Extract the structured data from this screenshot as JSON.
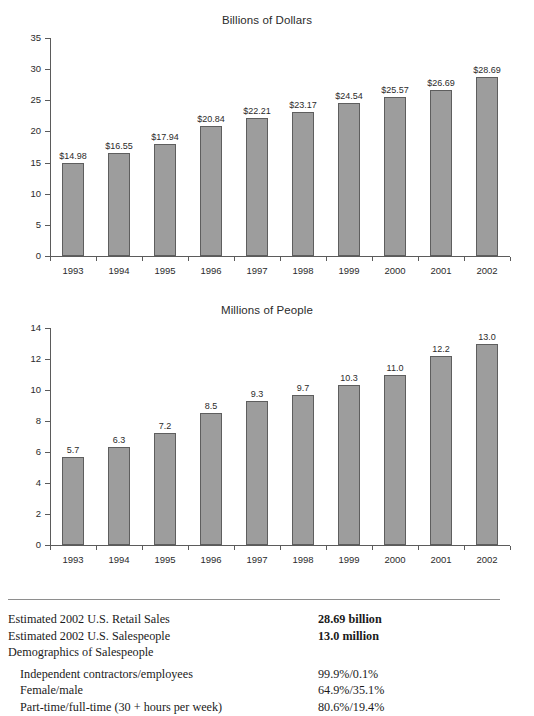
{
  "chart_data": [
    {
      "type": "bar",
      "title": "Billions of Dollars",
      "xlabel": "",
      "ylabel": "",
      "ylim": [
        0,
        35
      ],
      "yticks": [
        0,
        5,
        10,
        15,
        20,
        25,
        30,
        35
      ],
      "ytick_labels": [
        "0",
        "5",
        "10",
        "15",
        "20",
        "25",
        "30",
        "35"
      ],
      "grid": false,
      "legend": "none",
      "categories": [
        "1993",
        "1994",
        "1995",
        "1996",
        "1997",
        "1998",
        "1999",
        "2000",
        "2001",
        "2002"
      ],
      "values": [
        14.98,
        16.55,
        17.94,
        20.84,
        22.21,
        23.17,
        24.54,
        25.57,
        26.69,
        28.69
      ],
      "data_labels": [
        "$14.98",
        "$16.55",
        "$17.94",
        "$20.84",
        "$22.21",
        "$23.17",
        "$24.54",
        "$25.57",
        "$26.69",
        "$28.69"
      ],
      "bar_color": "#9d9d9d",
      "bar_border_color": "#5e5e5e"
    },
    {
      "type": "bar",
      "title": "Millions of People",
      "xlabel": "",
      "ylabel": "",
      "ylim": [
        0,
        14
      ],
      "yticks": [
        0,
        2,
        4,
        6,
        8,
        10,
        12,
        14
      ],
      "ytick_labels": [
        "0",
        "2",
        "4",
        "6",
        "8",
        "10",
        "12",
        "14"
      ],
      "grid": false,
      "legend": "none",
      "categories": [
        "1993",
        "1994",
        "1995",
        "1996",
        "1997",
        "1998",
        "1999",
        "2000",
        "2001",
        "2002"
      ],
      "values": [
        5.7,
        6.3,
        7.2,
        8.5,
        9.3,
        9.7,
        10.3,
        11.0,
        12.2,
        13.0
      ],
      "data_labels": [
        "5.7",
        "6.3",
        "7.2",
        "8.5",
        "9.3",
        "9.7",
        "10.3",
        "11.0",
        "12.2",
        "13.0"
      ],
      "bar_color": "#9d9d9d",
      "bar_border_color": "#5e5e5e"
    }
  ],
  "summary": {
    "rows": [
      {
        "label": "Estimated 2002 U.S. Retail Sales",
        "value": "28.69 billion",
        "bold": true,
        "indent": false
      },
      {
        "label": "Estimated 2002 U.S. Salespeople",
        "value": "13.0 million",
        "bold": true,
        "indent": false
      },
      {
        "label": "Demographics of Salespeople",
        "value": "",
        "bold": false,
        "indent": false
      },
      {
        "label": "Independent contractors/employees",
        "value": "99.9%/0.1%",
        "bold": false,
        "indent": true,
        "gap_before": true
      },
      {
        "label": "Female/male",
        "value": "64.9%/35.1%",
        "bold": false,
        "indent": true
      },
      {
        "label": "Part-time/full-time (30 + hours per week)",
        "value": "80.6%/19.4%",
        "bold": false,
        "indent": true
      }
    ]
  }
}
